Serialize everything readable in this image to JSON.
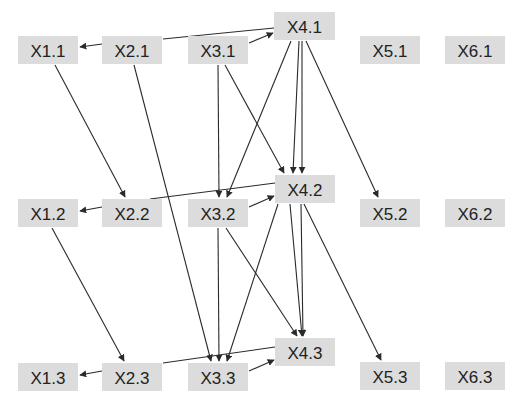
{
  "diagram": {
    "type": "directed-graph",
    "node_fill": "#dcdcdc",
    "edge_color": "#2a2a2a",
    "nodes": [
      {
        "id": "X1.1",
        "label": "X1.1",
        "x": 18,
        "y": 36,
        "w": 60,
        "h": 28
      },
      {
        "id": "X2.1",
        "label": "X2.1",
        "x": 102,
        "y": 36,
        "w": 60,
        "h": 28
      },
      {
        "id": "X3.1",
        "label": "X3.1",
        "x": 188,
        "y": 36,
        "w": 60,
        "h": 28
      },
      {
        "id": "X4.1",
        "label": "X4.1",
        "x": 274,
        "y": 12,
        "w": 61,
        "h": 28
      },
      {
        "id": "X5.1",
        "label": "X5.1",
        "x": 360,
        "y": 36,
        "w": 60,
        "h": 28
      },
      {
        "id": "X6.1",
        "label": "X6.1",
        "x": 445,
        "y": 36,
        "w": 60,
        "h": 28
      },
      {
        "id": "X1.2",
        "label": "X1.2",
        "x": 18,
        "y": 199,
        "w": 60,
        "h": 28
      },
      {
        "id": "X2.2",
        "label": "X2.2",
        "x": 102,
        "y": 199,
        "w": 60,
        "h": 28
      },
      {
        "id": "X3.2",
        "label": "X3.2",
        "x": 188,
        "y": 199,
        "w": 60,
        "h": 28
      },
      {
        "id": "X4.2",
        "label": "X4.2",
        "x": 275,
        "y": 175,
        "w": 60,
        "h": 28
      },
      {
        "id": "X5.2",
        "label": "X5.2",
        "x": 360,
        "y": 199,
        "w": 60,
        "h": 28
      },
      {
        "id": "X6.2",
        "label": "X6.2",
        "x": 445,
        "y": 199,
        "w": 60,
        "h": 28
      },
      {
        "id": "X1.3",
        "label": "X1.3",
        "x": 18,
        "y": 363,
        "w": 60,
        "h": 28
      },
      {
        "id": "X2.3",
        "label": "X2.3",
        "x": 102,
        "y": 363,
        "w": 60,
        "h": 28
      },
      {
        "id": "X3.3",
        "label": "X3.3",
        "x": 188,
        "y": 363,
        "w": 60,
        "h": 28
      },
      {
        "id": "X4.3",
        "label": "X4.3",
        "x": 275,
        "y": 338,
        "w": 60,
        "h": 28
      },
      {
        "id": "X5.3",
        "label": "X5.3",
        "x": 360,
        "y": 362,
        "w": 60,
        "h": 28
      },
      {
        "id": "X6.3",
        "label": "X6.3",
        "x": 445,
        "y": 362,
        "w": 60,
        "h": 28
      }
    ],
    "edges": [
      {
        "from": "X2.1",
        "to": "X1.1",
        "x1": 102,
        "y1": 44,
        "x2": 80,
        "y2": 47,
        "arrow": true
      },
      {
        "from": "X2.1",
        "to": "X4.1",
        "x1": 163,
        "y1": 39,
        "x2": 274,
        "y2": 28,
        "arrow": false
      },
      {
        "from": "X3.1",
        "to": "X4.1",
        "x1": 249,
        "y1": 43,
        "x2": 273,
        "y2": 33,
        "arrow": true
      },
      {
        "from": "X2.2",
        "to": "X1.2",
        "x1": 102,
        "y1": 207,
        "x2": 80,
        "y2": 211,
        "arrow": true
      },
      {
        "from": "X2.2",
        "to": "X4.2",
        "x1": 150,
        "y1": 199,
        "x2": 275,
        "y2": 183,
        "arrow": false
      },
      {
        "from": "X3.2",
        "to": "X4.2",
        "x1": 249,
        "y1": 207,
        "x2": 274,
        "y2": 196,
        "arrow": true
      },
      {
        "from": "X2.3",
        "to": "X1.3",
        "x1": 102,
        "y1": 371,
        "x2": 80,
        "y2": 375,
        "arrow": true
      },
      {
        "from": "X2.3",
        "to": "X4.3",
        "x1": 163,
        "y1": 363,
        "x2": 275,
        "y2": 347,
        "arrow": false
      },
      {
        "from": "X3.3",
        "to": "X4.3",
        "x1": 249,
        "y1": 371,
        "x2": 274,
        "y2": 360,
        "arrow": true
      },
      {
        "from": "X1.1",
        "to": "X2.2",
        "x1": 55,
        "y1": 65,
        "x2": 125,
        "y2": 197,
        "arrow": true
      },
      {
        "from": "X1.2",
        "to": "X2.3",
        "x1": 52,
        "y1": 228,
        "x2": 124,
        "y2": 361,
        "arrow": true
      },
      {
        "from": "X2.1",
        "to": "X3.3",
        "x1": 134,
        "y1": 65,
        "x2": 211,
        "y2": 361,
        "arrow": true
      },
      {
        "from": "X3.1",
        "to": "X3.2",
        "x1": 218,
        "y1": 65,
        "x2": 219,
        "y2": 197,
        "arrow": true
      },
      {
        "from": "X3.1",
        "to": "X4.2",
        "x1": 225,
        "y1": 65,
        "x2": 284,
        "y2": 173,
        "arrow": true
      },
      {
        "from": "X4.1",
        "to": "X3.2",
        "x1": 291,
        "y1": 41,
        "x2": 227,
        "y2": 197,
        "arrow": true
      },
      {
        "from": "X4.1",
        "to": "X4.2",
        "x1": 299,
        "y1": 41,
        "x2": 293,
        "y2": 173,
        "arrow": true
      },
      {
        "from": "X4.1",
        "to": "X4.2",
        "x1": 302,
        "y1": 41,
        "x2": 302,
        "y2": 173,
        "arrow": true
      },
      {
        "from": "X4.1",
        "to": "X5.2",
        "x1": 306,
        "y1": 41,
        "x2": 378,
        "y2": 197,
        "arrow": true
      },
      {
        "from": "X3.2",
        "to": "X3.3",
        "x1": 218,
        "y1": 228,
        "x2": 219,
        "y2": 361,
        "arrow": true
      },
      {
        "from": "X3.2",
        "to": "X4.3",
        "x1": 226,
        "y1": 228,
        "x2": 297,
        "y2": 336,
        "arrow": true
      },
      {
        "from": "X4.2",
        "to": "X3.3",
        "x1": 278,
        "y1": 204,
        "x2": 227,
        "y2": 361,
        "arrow": true
      },
      {
        "from": "X4.2",
        "to": "X4.3",
        "x1": 290,
        "y1": 204,
        "x2": 302,
        "y2": 336,
        "arrow": true
      },
      {
        "from": "X4.2",
        "to": "X4.3",
        "x1": 301,
        "y1": 204,
        "x2": 303,
        "y2": 336,
        "arrow": true
      },
      {
        "from": "X4.2",
        "to": "X5.3",
        "x1": 304,
        "y1": 204,
        "x2": 381,
        "y2": 360,
        "arrow": true
      }
    ]
  }
}
